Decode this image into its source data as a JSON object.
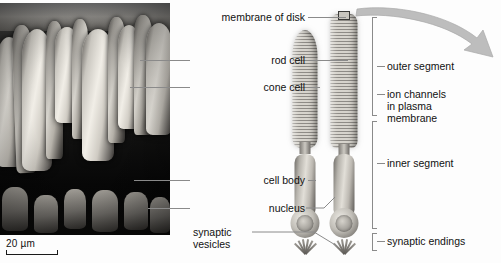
{
  "figure": {
    "background_color": "#ffffff",
    "leader_color": "#8a8a8a",
    "text_color": "#111111"
  },
  "micrograph": {
    "type": "scanning electron micrograph",
    "subject": "retinal photoreceptor outer segments",
    "scale_bar": {
      "label": "20 µm",
      "value": 20,
      "unit": "µm"
    }
  },
  "labels_left": [
    {
      "id": "membrane-of-disk",
      "text": "membrane of disk"
    },
    {
      "id": "rod-cell",
      "text": "rod cell"
    },
    {
      "id": "cone-cell",
      "text": "cone cell"
    },
    {
      "id": "cell-body",
      "text": "cell body"
    },
    {
      "id": "nucleus",
      "text": "nucleus"
    },
    {
      "id": "synaptic-vesicles",
      "text": "synaptic\nvesicles"
    }
  ],
  "labels_right": [
    {
      "id": "outer-segment",
      "text": "outer segment"
    },
    {
      "id": "ion-channels",
      "text": "ion channels\nin plasma\nmembrane"
    },
    {
      "id": "inner-segment",
      "text": "inner segment"
    },
    {
      "id": "synaptic-endings",
      "text": "synaptic endings"
    }
  ],
  "cells": [
    {
      "id": "cone-cell-illustration",
      "name": "cone cell"
    },
    {
      "id": "rod-cell-illustration",
      "name": "rod cell"
    }
  ],
  "arrow": {
    "id": "magnification-arrow",
    "description": "curved arrow from membrane of disk"
  }
}
